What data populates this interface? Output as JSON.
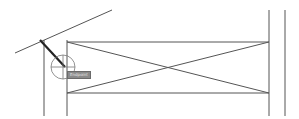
{
  "canvas": {
    "background": "#ffffff",
    "line_color": "#555555",
    "width": 299,
    "height": 119
  },
  "drawing": {
    "left_verticals": [
      {
        "x": 44,
        "y1": 40,
        "y2": 116
      },
      {
        "x": 67,
        "y1": 40,
        "y2": 116
      }
    ],
    "right_verticals": [
      {
        "x": 269,
        "y1": 10,
        "y2": 116
      },
      {
        "x": 285,
        "y1": 10,
        "y2": 116
      }
    ],
    "horizontals": [
      {
        "y": 42,
        "x1": 67,
        "x2": 269
      },
      {
        "y": 93,
        "x1": 67,
        "x2": 269
      }
    ],
    "cross": [
      {
        "x1": 67,
        "y1": 42,
        "x2": 269,
        "y2": 93
      },
      {
        "x1": 67,
        "y1": 93,
        "x2": 269,
        "y2": 42
      }
    ],
    "slanted_line": {
      "x1": 15,
      "y1": 53,
      "x2": 112,
      "y2": 10
    },
    "selected_line": {
      "x1": 40,
      "y1": 40,
      "x2": 65,
      "y2": 67
    },
    "snap_marker": {
      "cx": 63,
      "cy": 67,
      "r": 12
    }
  },
  "tooltip": {
    "label": "Endpoint"
  }
}
